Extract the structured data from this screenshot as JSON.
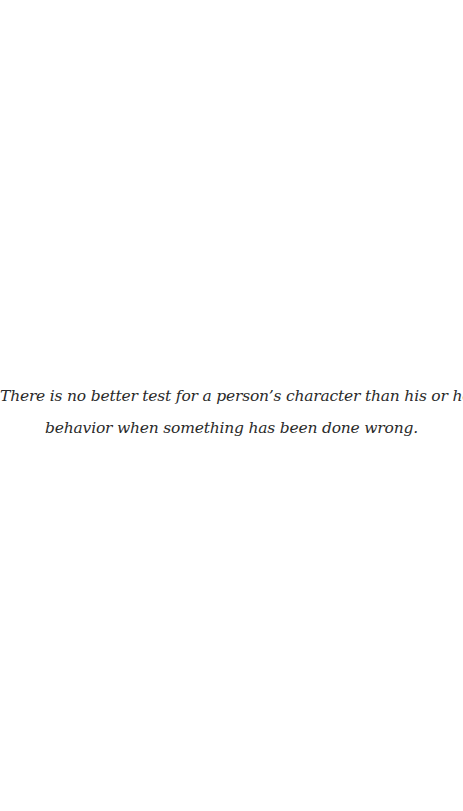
{
  "page": {
    "background_color": "#ffffff",
    "text_color": "#2a2a2a"
  },
  "quote": {
    "lines": [
      "There is no better test for a person’s character than his or her",
      "behavior when something has been done wrong."
    ]
  }
}
